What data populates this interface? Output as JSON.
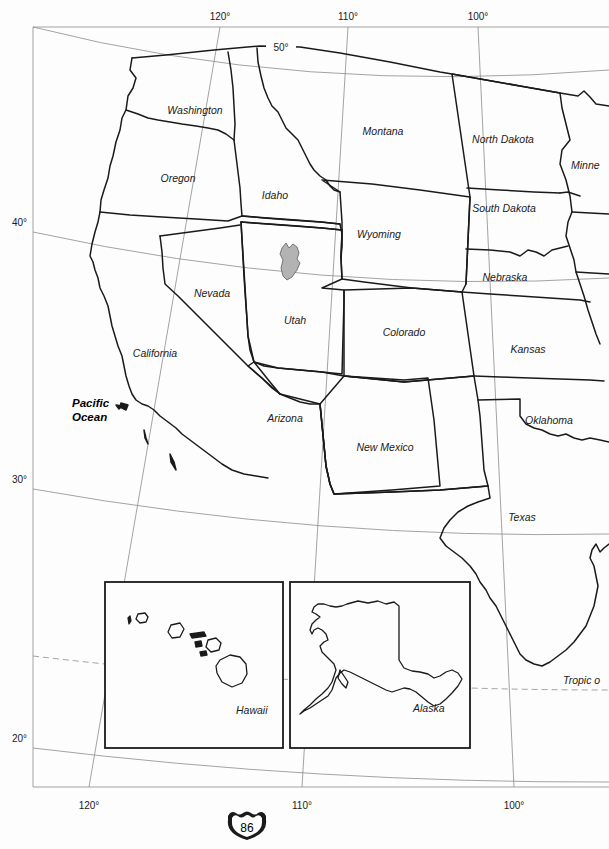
{
  "page": {
    "page_number": "86",
    "page_marker_icon": "interstate-shield-icon",
    "background_color": "#fdfdfd",
    "line_color": "#1a1a1a",
    "graticule_color": "#8c8c8c",
    "lake_fill_color": "#b3b3b3"
  },
  "map": {
    "frame": {
      "x": 33,
      "y": 27,
      "width": 576,
      "height": 760
    },
    "ocean_labels": [
      {
        "name": "pacific-ocean",
        "line1": "Pacific",
        "line2": "Ocean",
        "x": 74,
        "y": 407
      }
    ],
    "state_labels": [
      {
        "name": "washington",
        "label": "Washington",
        "x": 195,
        "y": 110
      },
      {
        "name": "oregon",
        "label": "Oregon",
        "x": 178,
        "y": 178
      },
      {
        "name": "idaho",
        "label": "Idaho",
        "x": 275,
        "y": 195
      },
      {
        "name": "montana",
        "label": "Montana",
        "x": 383,
        "y": 131
      },
      {
        "name": "north-dakota",
        "label": "North Dakota",
        "x": 502,
        "y": 139
      },
      {
        "name": "minnesota",
        "label": "Minne",
        "x": 588,
        "y": 165
      },
      {
        "name": "south-dakota",
        "label": "South Dakota",
        "x": 504,
        "y": 208
      },
      {
        "name": "wyoming",
        "label": "Wyoming",
        "x": 379,
        "y": 234
      },
      {
        "name": "nebraska",
        "label": "Nebraska",
        "x": 505,
        "y": 277
      },
      {
        "name": "nevada",
        "label": "Nevada",
        "x": 212,
        "y": 293
      },
      {
        "name": "utah",
        "label": "Utah",
        "x": 295,
        "y": 320
      },
      {
        "name": "colorado",
        "label": "Colorado",
        "x": 404,
        "y": 332
      },
      {
        "name": "kansas",
        "label": "Kansas",
        "x": 528,
        "y": 349
      },
      {
        "name": "california",
        "label": "California",
        "x": 155,
        "y": 353
      },
      {
        "name": "arizona",
        "label": "Arizona",
        "x": 285,
        "y": 418
      },
      {
        "name": "new-mexico",
        "label": "New Mexico",
        "x": 385,
        "y": 447
      },
      {
        "name": "oklahoma",
        "label": "Oklahoma",
        "x": 549,
        "y": 420
      },
      {
        "name": "texas",
        "label": "Texas",
        "x": 522,
        "y": 517
      }
    ],
    "graticule": {
      "top_longitude_labels": [
        {
          "label": "120°",
          "x": 220,
          "y": 20
        },
        {
          "label": "110°",
          "x": 348,
          "y": 20
        },
        {
          "label": "100°",
          "x": 478,
          "y": 20
        }
      ],
      "bottom_longitude_labels": [
        {
          "label": "120°",
          "x": 89,
          "y": 809
        },
        {
          "label": "110°",
          "x": 302,
          "y": 809
        },
        {
          "label": "100°",
          "x": 514,
          "y": 809
        }
      ],
      "left_latitude_labels": [
        {
          "label": "50°",
          "x": 280,
          "y": 51,
          "on_line": true
        },
        {
          "label": "40°",
          "x": 18,
          "y": 222
        },
        {
          "label": "30°",
          "x": 18,
          "y": 479
        },
        {
          "label": "20°",
          "x": 18,
          "y": 738
        }
      ],
      "special_lines": [
        {
          "name": "tropic-of-cancer",
          "label": "Tropic o",
          "x": 566,
          "y": 684,
          "style": "dashed"
        }
      ]
    },
    "insets": [
      {
        "name": "hawaii-inset",
        "label": "Hawaii",
        "label_x": 236,
        "label_y": 710,
        "box": {
          "x": 105,
          "y": 582,
          "width": 178,
          "height": 166
        }
      },
      {
        "name": "alaska-inset",
        "label": "Alaska",
        "label_x": 413,
        "label_y": 708,
        "box": {
          "x": 290,
          "y": 582,
          "width": 180,
          "height": 166
        }
      }
    ]
  }
}
